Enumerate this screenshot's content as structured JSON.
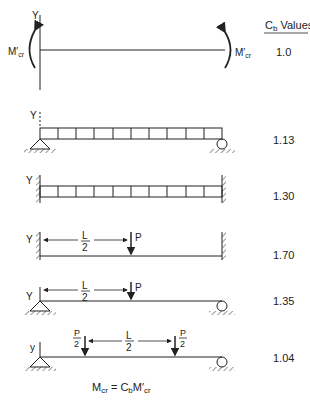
{
  "header": {
    "cb_label": "C",
    "cb_sub": "b",
    "cb_suffix": " Values"
  },
  "cases": [
    {
      "id": "uniform-moment",
      "value": "1.0",
      "labels": {
        "y": "Y",
        "m_left": "M",
        "m_right": "M",
        "m_sub": "cr",
        "prime": "′"
      }
    },
    {
      "id": "simple-udl",
      "value": "1.13",
      "labels": {
        "y": "Y"
      }
    },
    {
      "id": "fixed-udl",
      "value": "1.30",
      "labels": {
        "y": "Y"
      }
    },
    {
      "id": "fixed-center-point",
      "value": "1.70",
      "labels": {
        "y": "Y",
        "span": "L",
        "span_den": "2",
        "load": "P"
      }
    },
    {
      "id": "simple-center-point",
      "value": "1.35",
      "labels": {
        "y": "Y",
        "span": "L",
        "span_den": "2",
        "load": "P"
      }
    },
    {
      "id": "simple-two-point",
      "value": "1.04",
      "labels": {
        "y": "y",
        "span": "L",
        "span_den": "2",
        "load": "P",
        "load_den": "2"
      }
    }
  ],
  "formula": {
    "lhs": "M",
    "lhs_sub": "cr",
    "eq": " = ",
    "c": "C",
    "c_sub": "b",
    "m": "M",
    "m_sub": "cr",
    "prime": "′"
  }
}
